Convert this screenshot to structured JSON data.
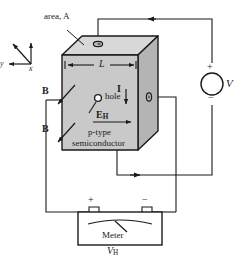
{
  "figure": {
    "type": "physics-diagram",
    "labels": {
      "area": "area, A",
      "length": "L",
      "hole": "hole",
      "field_1": "B",
      "field_2": "B",
      "hall_field": "E",
      "hall_field_sub": "H",
      "current": "I",
      "material_line1": "p-type",
      "material_line2": "semiconductor",
      "source_voltage": "V",
      "source_plus": "+",
      "source_minus": "−",
      "meter_name": "Meter",
      "meter_plus": "+",
      "meter_minus": "−",
      "hall_voltage": "V",
      "hall_voltage_sub": "H",
      "axis_x": "x",
      "axis_y": "y",
      "axis_z": "z"
    },
    "colors": {
      "stroke": "#1a1a1a",
      "face_front": "#c9c9c9",
      "face_top": "#d8d8d8",
      "face_right": "#b4b4b4",
      "background": "#ffffff"
    }
  }
}
